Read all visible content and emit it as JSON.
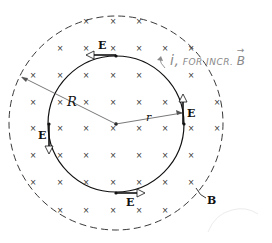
{
  "figure": {
    "colors": {
      "ink": "#111111",
      "handwriting": "#8a8a8a",
      "background": "#ffffff"
    },
    "labels": {
      "E_top": "E",
      "E_right": "E",
      "E_left": "E",
      "E_bottom": "E",
      "R": "R",
      "r": "r",
      "B": "B"
    },
    "annotation": {
      "symbol": "i,",
      "text": "FOR INCR.",
      "vector": "B",
      "vector_arrow": "→"
    },
    "field_symbol": "×",
    "geometry": {
      "center": [
        116,
        124
      ],
      "field_region_radius": 107,
      "loop_radius": 68
    },
    "field_marks": [
      [
        86,
        22
      ],
      [
        113,
        22
      ],
      [
        139,
        22
      ],
      [
        60,
        49
      ],
      [
        86,
        49
      ],
      [
        113,
        49
      ],
      [
        139,
        49
      ],
      [
        165,
        49
      ],
      [
        191,
        49
      ],
      [
        33,
        76
      ],
      [
        60,
        76
      ],
      [
        86,
        76
      ],
      [
        113,
        76
      ],
      [
        139,
        76
      ],
      [
        191,
        76
      ],
      [
        33,
        103
      ],
      [
        60,
        103
      ],
      [
        86,
        103
      ],
      [
        113,
        103
      ],
      [
        139,
        103
      ],
      [
        165,
        103
      ],
      [
        217,
        103
      ],
      [
        33,
        129
      ],
      [
        60,
        129
      ],
      [
        86,
        129
      ],
      [
        113,
        129
      ],
      [
        139,
        129
      ],
      [
        165,
        129
      ],
      [
        191,
        129
      ],
      [
        217,
        129
      ],
      [
        33,
        156
      ],
      [
        60,
        156
      ],
      [
        86,
        156
      ],
      [
        113,
        156
      ],
      [
        139,
        156
      ],
      [
        165,
        156
      ],
      [
        191,
        156
      ],
      [
        33,
        183
      ],
      [
        60,
        183
      ],
      [
        86,
        183
      ],
      [
        113,
        183
      ],
      [
        139,
        183
      ],
      [
        165,
        183
      ],
      [
        191,
        183
      ],
      [
        60,
        211
      ],
      [
        86,
        211
      ],
      [
        113,
        211
      ],
      [
        139,
        211
      ],
      [
        165,
        211
      ]
    ]
  }
}
